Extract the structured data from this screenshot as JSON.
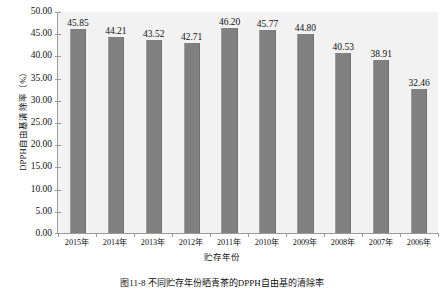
{
  "chart_data": {
    "type": "bar",
    "title": "",
    "xlabel": "贮存年份",
    "ylabel": "DPPH自由基清除率（%）",
    "categories": [
      "2015年",
      "2014年",
      "2013年",
      "2012年",
      "2011年",
      "2010年",
      "2009年",
      "2008年",
      "2007年",
      "2006年"
    ],
    "values": [
      45.85,
      44.21,
      43.52,
      42.71,
      46.2,
      45.77,
      44.8,
      40.53,
      38.91,
      32.46
    ],
    "value_labels": [
      "45.85",
      "44.21",
      "43.52",
      "42.71",
      "46.20",
      "45.77",
      "44.80",
      "40.53",
      "38.91",
      "32.46"
    ],
    "ylim": [
      0,
      50
    ],
    "ytick_values": [
      0,
      5,
      10,
      15,
      20,
      25,
      30,
      35,
      40,
      45,
      50
    ],
    "ytick_labels": [
      "0.00",
      "5.00",
      "10.00",
      "15.00",
      "20.00",
      "25.00",
      "30.00",
      "35.00",
      "40.00",
      "45.00",
      "50.00"
    ],
    "grid": false,
    "legend": "none",
    "series_color": "#808080",
    "plot_background": "#f2f2f2",
    "axis_color": "#9a9a9a"
  },
  "caption": {
    "text": "图11-8  不同贮存年份晒青茶的DPPH自由基的清除率"
  }
}
